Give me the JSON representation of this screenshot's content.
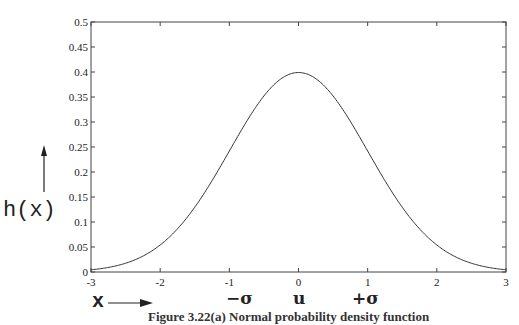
{
  "chart_data": {
    "type": "line",
    "title": "",
    "xlabel": "x",
    "ylabel": "h(x)",
    "xlim": [
      -3,
      3
    ],
    "ylim": [
      0,
      0.5
    ],
    "x_ticks": [
      "-3",
      "-2",
      "-1",
      "0",
      "1",
      "2",
      "3"
    ],
    "y_ticks": [
      "0",
      "0.05",
      "0.1",
      "0.15",
      "0.2",
      "0.25",
      "0.3",
      "0.35",
      "0.4",
      "0.45",
      "0.5"
    ],
    "grid": false,
    "legend": null,
    "series": [
      {
        "name": "standard normal density",
        "x": [
          -3,
          -2.5,
          -2,
          -1.5,
          -1,
          -0.5,
          0,
          0.5,
          1,
          1.5,
          2,
          2.5,
          3
        ],
        "values": [
          0.0044,
          0.0175,
          0.054,
          0.1295,
          0.242,
          0.3521,
          0.3989,
          0.3521,
          0.242,
          0.1295,
          0.054,
          0.0175,
          0.0044
        ]
      }
    ],
    "annotations": [
      "-σ",
      "u",
      "+σ"
    ]
  },
  "labels": {
    "ylabel": "h(x)",
    "xlabel": "x",
    "minus_sigma": "−σ",
    "mean": "u",
    "plus_sigma": "+σ",
    "caption": "Figure 3.22(a) Normal probability density function"
  }
}
